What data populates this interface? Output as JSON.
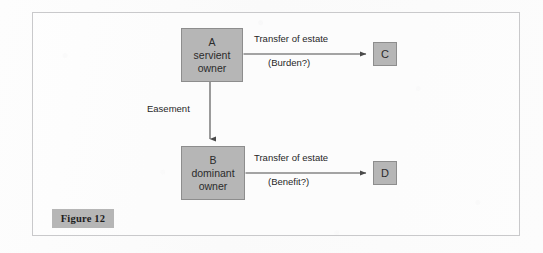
{
  "figure": {
    "caption": "Figure 12",
    "frame_border_color": "#c9c9cb",
    "background_color": "#fcfcfc",
    "node_fill_color": "#b6b6b6",
    "node_border_color": "#8d8d8d",
    "arrow_color": "#4a4a4a"
  },
  "nodes": {
    "a": {
      "line1": "A",
      "line2": "servient",
      "line3": "owner"
    },
    "b": {
      "line1": "B",
      "line2": "dominant",
      "line3": "owner"
    },
    "c": {
      "label": "C"
    },
    "d": {
      "label": "D"
    }
  },
  "edges": {
    "a_to_c": {
      "label_above": "Transfer of estate",
      "label_below": "(Burden?)"
    },
    "a_to_b": {
      "label": "Easement"
    },
    "b_to_d": {
      "label_above": "Transfer of estate",
      "label_below": "(Benefit?)"
    }
  }
}
